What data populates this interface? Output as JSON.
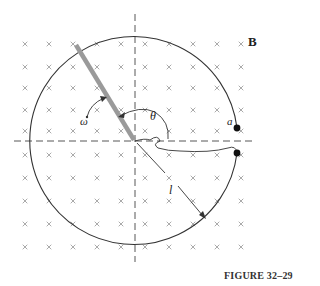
{
  "figure": {
    "caption": "FIGURE 32–29",
    "labels": {
      "field": "B",
      "point_a": "a",
      "angle": "θ",
      "angular_velocity": "ω",
      "length": "l"
    },
    "field_symbol": "×",
    "colors": {
      "line": "#333333",
      "rod": "#9a9a9a",
      "field_marks": "#999999",
      "dot": "#111111"
    }
  }
}
